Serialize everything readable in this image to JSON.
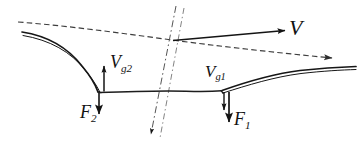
{
  "figure": {
    "background_color": "#ffffff",
    "stroke_color": "#1a1a1a",
    "dashed_stroke_color": "#4a4a4a",
    "width": 362,
    "height": 158
  },
  "labels": {
    "free_stream_velocity": {
      "symbol": "V",
      "subscript": ""
    },
    "gap_velocity_2": {
      "symbol": "V",
      "subscript": "g2"
    },
    "gap_velocity_1": {
      "symbol": "V",
      "subscript": "g1"
    },
    "force_2": {
      "symbol": "F",
      "subscript": "2"
    },
    "force_1": {
      "symbol": "F",
      "subscript": "1"
    }
  },
  "vectors": [
    {
      "name": "V",
      "direction": "right",
      "magnitude_relative": "long",
      "origin": "axis-intersection"
    },
    {
      "name": "Vg2",
      "direction": "up",
      "magnitude_relative": "short",
      "origin": "blade-2-trailing-edge"
    },
    {
      "name": "Vg1",
      "direction": "down",
      "magnitude_relative": "short",
      "origin": "blade-1-trailing-edge"
    },
    {
      "name": "F2",
      "direction": "down",
      "magnitude_relative": "medium",
      "origin": "blade-2-trailing-edge"
    },
    {
      "name": "F1",
      "direction": "down",
      "magnitude_relative": "long",
      "origin": "blade-1-trailing-edge"
    }
  ],
  "geometry": {
    "blade_count": 2,
    "dashed_reference_line": "upper inclined dashed line with arrowhead at right",
    "dash_dot_axis": "near-vertical inclined dash-dot line pair with arrowhead at bottom",
    "connecting_streamline": "slightly curved line joining the two blade trailing edges"
  }
}
